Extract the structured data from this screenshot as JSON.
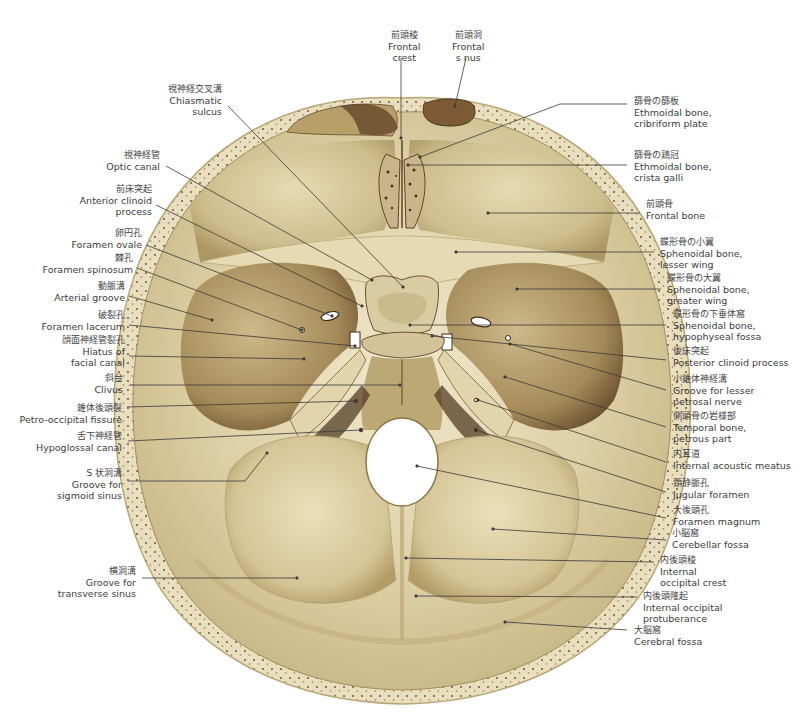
{
  "figure": {
    "colors": {
      "background": "#ffffff",
      "bone_light": "#efe6c8",
      "bone_mid": "#d8c89c",
      "bone_dark": "#a8925e",
      "shadow": "#5e4526",
      "diploe_dots": "#6b5a3c",
      "leader_line": "#3a3a3a"
    }
  },
  "labels_top": [
    {
      "id": "frontal-crest",
      "ja": "前頭稜",
      "en": [
        "Frontal",
        "crest"
      ],
      "x": 388,
      "y": 30,
      "lead": [
        [
          401,
          58
        ],
        [
          401,
          138
        ]
      ]
    },
    {
      "id": "frontal-sinus",
      "ja": "前頭洞",
      "en": [
        "Frontal",
        "s nus"
      ],
      "x": 452,
      "y": 30,
      "lead": [
        [
          466,
          58
        ],
        [
          455,
          106
        ]
      ]
    }
  ],
  "labels_left": [
    {
      "id": "chiasmatic-sulcus",
      "ja": "視神経交叉溝",
      "en": [
        "Chiasmatic",
        "sulcus"
      ],
      "x": 222,
      "y": 84,
      "lead": [
        [
          228,
          106
        ],
        [
          403,
          287
        ]
      ]
    },
    {
      "id": "optic-canal",
      "ja": "視神経管",
      "en": [
        "Optic canal"
      ],
      "x": 160,
      "y": 150,
      "lead": [
        [
          166,
          166
        ],
        [
          372,
          280
        ]
      ]
    },
    {
      "id": "anterior-clinoid-process",
      "ja": "前床突起",
      "en": [
        "Anterior clinoid",
        "process"
      ],
      "x": 152,
      "y": 184,
      "lead": [
        [
          156,
          205
        ],
        [
          362,
          306
        ]
      ]
    },
    {
      "id": "foramen-ovale",
      "ja": "卵円孔",
      "en": [
        "Foramen ovale"
      ],
      "x": 142,
      "y": 228,
      "lead": [
        [
          146,
          245
        ],
        [
          332,
          316
        ]
      ]
    },
    {
      "id": "foramen-spinosum",
      "ja": "棘孔",
      "en": [
        "Foramen spinosum"
      ],
      "x": 133,
      "y": 253,
      "lead": [
        [
          137,
          268
        ],
        [
          302,
          330
        ]
      ]
    },
    {
      "id": "arterial-groove",
      "ja": "動脈溝",
      "en": [
        "Arterial groove"
      ],
      "x": 125,
      "y": 281,
      "lead": [
        [
          129,
          296
        ],
        [
          212,
          320
        ]
      ]
    },
    {
      "id": "foramen-lacerum",
      "ja": "破裂孔",
      "en": [
        "Foramen lacerum"
      ],
      "x": 125,
      "y": 310,
      "lead": [
        [
          129,
          325
        ],
        [
          355,
          346
        ]
      ]
    },
    {
      "id": "hiatus-facial-canal",
      "ja": "顔面神経管裂孔",
      "en": [
        "Hiatus of",
        "facial canal"
      ],
      "x": 125,
      "y": 335,
      "lead": [
        [
          129,
          356
        ],
        [
          304,
          359
        ]
      ]
    },
    {
      "id": "clivus",
      "ja": "斜台",
      "en": [
        "Clivus"
      ],
      "x": 123,
      "y": 373,
      "lead": [
        [
          129,
          385
        ],
        [
          400,
          385
        ]
      ]
    },
    {
      "id": "petro-occipital-fissure",
      "ja": "錐体後頭裂",
      "en": [
        "Petro-occipital fissure"
      ],
      "x": 122,
      "y": 403,
      "lead": [
        [
          127,
          407
        ],
        [
          356,
          401
        ]
      ]
    },
    {
      "id": "hypoglossal-canal",
      "ja": "舌下神経管",
      "en": [
        "Hypoglossal canal"
      ],
      "x": 122,
      "y": 431,
      "lead": [
        [
          128,
          441
        ],
        [
          361,
          430
        ]
      ]
    },
    {
      "id": "groove-sigmoid-sinus",
      "ja": "S 状洞溝",
      "en": [
        "Groove for",
        "sigmoid sinus"
      ],
      "x": 122,
      "y": 468,
      "lead": [
        [
          128,
          481
        ],
        [
          245,
          481
        ],
        [
          267,
          453
        ]
      ]
    },
    {
      "id": "groove-transverse-sinus",
      "ja": "横洞溝",
      "en": [
        "Groove for",
        "transverse sinus"
      ],
      "x": 136,
      "y": 566,
      "lead": [
        [
          142,
          578
        ],
        [
          297,
          578
        ]
      ]
    }
  ],
  "labels_right": [
    {
      "id": "ethmoidal-cribriform-plate",
      "ja": "篩骨の篩板",
      "en": [
        "Ethmoidal bone,",
        "cribriform plate"
      ],
      "x": 634,
      "y": 96,
      "lead": [
        [
          627,
          104
        ],
        [
          560,
          104
        ],
        [
          420,
          157
        ]
      ]
    },
    {
      "id": "ethmoidal-crista-galli",
      "ja": "篩骨の鶏冠",
      "en": [
        "Ethmoidal bone,",
        "crista galli"
      ],
      "x": 634,
      "y": 150,
      "lead": [
        [
          627,
          165
        ],
        [
          408,
          165
        ]
      ]
    },
    {
      "id": "frontal-bone",
      "ja": "前頭骨",
      "en": [
        "Frontal bone"
      ],
      "x": 646,
      "y": 199,
      "lead": [
        [
          640,
          213
        ],
        [
          488,
          213
        ]
      ]
    },
    {
      "id": "sphenoidal-lesser-wing",
      "ja": "蝶形骨の小翼",
      "en": [
        "Sphenoidal bone,",
        "lesser wing"
      ],
      "x": 660,
      "y": 237,
      "lead": [
        [
          654,
          252
        ],
        [
          456,
          252
        ]
      ]
    },
    {
      "id": "sphenoidal-greater-wing",
      "ja": "蝶形骨の大翼",
      "en": [
        "Sphenoidal bone,",
        "greater wing"
      ],
      "x": 667,
      "y": 273,
      "lead": [
        [
          661,
          289
        ],
        [
          517,
          289
        ]
      ]
    },
    {
      "id": "sphenoidal-hypophyseal-fossa",
      "ja": "蝶形骨の下垂体窩",
      "en": [
        "Sphenoidal bone,",
        "hypophyseal fossa"
      ],
      "x": 673,
      "y": 309,
      "lead": [
        [
          666,
          325
        ],
        [
          410,
          325
        ]
      ]
    },
    {
      "id": "posterior-clinoid-process",
      "ja": "後床突起",
      "en": [
        "Posterior clinoid process"
      ],
      "x": 673,
      "y": 346,
      "lead": [
        [
          666,
          360
        ],
        [
          432,
          336
        ]
      ]
    },
    {
      "id": "groove-lesser-petrosal-nerve",
      "ja": "小錐体神経溝",
      "en": [
        "Groove for lesser",
        "petrosal nerve"
      ],
      "x": 673,
      "y": 374,
      "lead": [
        [
          666,
          390
        ],
        [
          510,
          344
        ]
      ]
    },
    {
      "id": "temporal-petrous-part",
      "ja": "側頭骨の岩様部",
      "en": [
        "Temporal bone,",
        "petrous part"
      ],
      "x": 673,
      "y": 411,
      "lead": [
        [
          666,
          427
        ],
        [
          505,
          377
        ]
      ]
    },
    {
      "id": "internal-acoustic-meatus",
      "ja": "内耳道",
      "en": [
        "Internal acoustic meatus"
      ],
      "x": 673,
      "y": 449,
      "lead": [
        [
          666,
          462
        ],
        [
          478,
          400
        ]
      ]
    },
    {
      "id": "jugular-foramen",
      "ja": "頸静脈孔",
      "en": [
        "Jugular foramen"
      ],
      "x": 673,
      "y": 478,
      "lead": [
        [
          666,
          492
        ],
        [
          476,
          430
        ]
      ]
    },
    {
      "id": "foramen-magnum",
      "ja": "大後頭孔",
      "en": [
        "Foramen magnum"
      ],
      "x": 673,
      "y": 505,
      "lead": [
        [
          666,
          518
        ],
        [
          417,
          466
        ]
      ]
    },
    {
      "id": "cerebellar-fossa",
      "ja": "小脳窩",
      "en": [
        "Cerebellar fossa"
      ],
      "x": 672,
      "y": 528,
      "lead": [
        [
          666,
          540
        ],
        [
          493,
          529
        ]
      ]
    },
    {
      "id": "internal-occipital-crest",
      "ja": "内後頭稜",
      "en": [
        "Internal",
        "occipital crest"
      ],
      "x": 660,
      "y": 555,
      "lead": [
        [
          654,
          562
        ],
        [
          406,
          558
        ]
      ]
    },
    {
      "id": "internal-occipital-protuberance",
      "ja": "内後頭隆起",
      "en": [
        "Internal occipital",
        "protuberance"
      ],
      "x": 643,
      "y": 591,
      "lead": [
        [
          637,
          597
        ],
        [
          416,
          596
        ]
      ]
    },
    {
      "id": "cerebral-fossa",
      "ja": "大脳窩",
      "en": [
        "Cerebral fossa"
      ],
      "x": 634,
      "y": 625,
      "lead": [
        [
          627,
          630
        ],
        [
          505,
          622
        ]
      ]
    }
  ]
}
